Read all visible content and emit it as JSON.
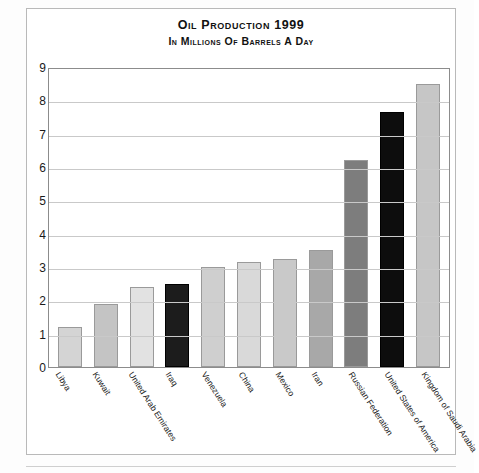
{
  "chart_data": {
    "type": "bar",
    "title": "Oil Production 1999",
    "subtitle": "in Millions of Barrels a Day",
    "xlabel": "",
    "ylabel": "",
    "ylim": [
      0,
      9
    ],
    "yticks": [
      0,
      1,
      2,
      3,
      4,
      5,
      6,
      7,
      8,
      9
    ],
    "grid": true,
    "legend": "none",
    "categories": [
      "Libya",
      "Kuwait",
      "United Arab Emirates",
      "Iraq",
      "Venezuela",
      "China",
      "Mexico",
      "Iran",
      "Russian Federation",
      "United States of America",
      "Kingdom of Saudi Arabia"
    ],
    "values": [
      1.2,
      1.9,
      2.4,
      2.5,
      3.0,
      3.15,
      3.25,
      3.5,
      6.2,
      7.65,
      8.5
    ],
    "bar_colors": [
      "#d4d4d4",
      "#c4c4c4",
      "#e2e2e2",
      "#1c1c1c",
      "#cfcfcf",
      "#d9d9d9",
      "#c9c9c9",
      "#a8a8a8",
      "#7d7d7d",
      "#0d0d0d",
      "#c6c6c6"
    ]
  },
  "colors": {
    "frame": "#b9b9b9",
    "plot_border": "#8c8c8c",
    "gridline": "#c9c9c9",
    "text": "#1a1a1a",
    "background": "#ffffff"
  }
}
